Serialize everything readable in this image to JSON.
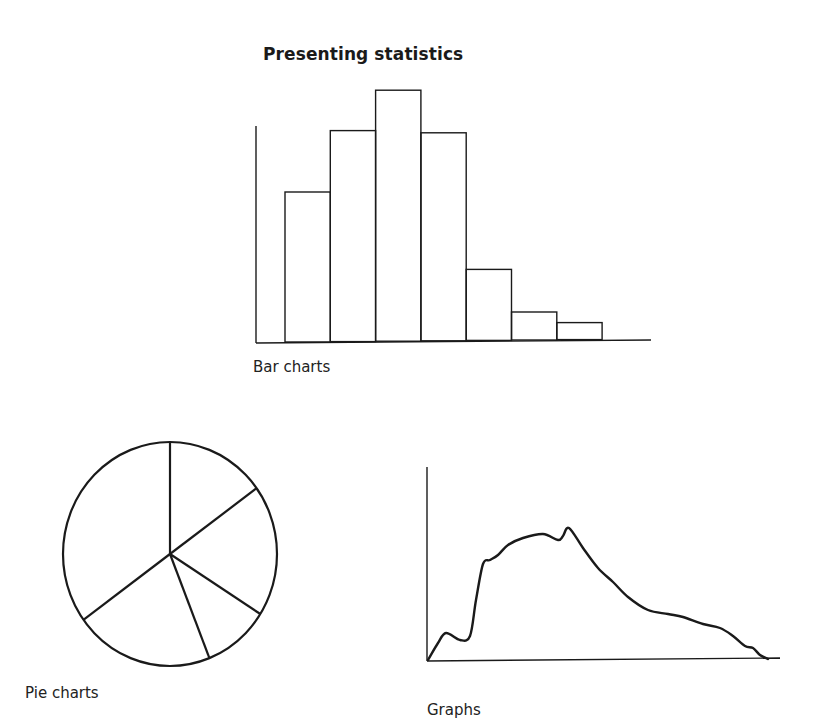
{
  "title": "Presenting statistics",
  "captions": {
    "bar": "Bar charts",
    "pie": "Pie charts",
    "graph": "Graphs"
  },
  "colors": {
    "stroke": "#1a1a1a",
    "background": "#ffffff"
  },
  "chart_data": [
    {
      "type": "bar",
      "title": "Bar charts",
      "categories": [
        "1",
        "2",
        "3",
        "4",
        "5",
        "6",
        "7"
      ],
      "values": [
        150,
        211,
        251,
        208,
        71,
        28,
        17
      ],
      "xlabel": "",
      "ylabel": "",
      "ylim": [
        0,
        216
      ],
      "grid": false,
      "notes": "Unlabeled illustrative histogram; values are relative pixel heights"
    },
    {
      "type": "pie",
      "title": "Pie charts",
      "slices": [
        {
          "label": "A",
          "value": 15
        },
        {
          "label": "B",
          "value": 19
        },
        {
          "label": "C",
          "value": 10
        },
        {
          "label": "D",
          "value": 21
        },
        {
          "label": "E",
          "value": 35
        }
      ],
      "notes": "Unlabeled illustrative pie with 5 slices; values are estimated percentages clockwise from top"
    },
    {
      "type": "line",
      "title": "Graphs",
      "x": [
        0,
        10,
        18,
        32,
        42,
        48,
        55,
        62,
        70,
        80,
        95,
        115,
        130,
        135,
        141,
        155,
        170,
        185,
        200,
        220,
        240,
        255,
        275,
        292,
        305,
        317,
        325,
        332,
        340
      ],
      "y": [
        0,
        17,
        27,
        20,
        24,
        60,
        96,
        100,
        105,
        115,
        122,
        126,
        120,
        124,
        132,
        112,
        92,
        78,
        63,
        50,
        46,
        43,
        36,
        32,
        24,
        14,
        12,
        5,
        1
      ],
      "xlabel": "",
      "ylabel": "",
      "grid": false,
      "notes": "Unlabeled illustrative distribution curve; values are relative pixel coordinates"
    }
  ]
}
